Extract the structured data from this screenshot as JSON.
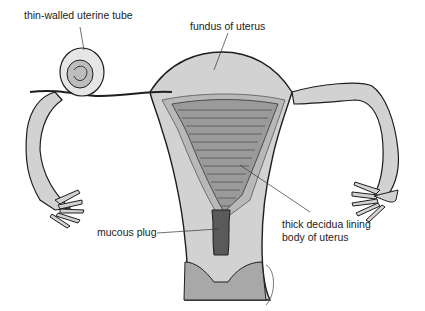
{
  "diagram": {
    "colors": {
      "tissue_light": "#d2d2d2",
      "tissue_mid": "#b8b8b8",
      "tissue_dark": "#8e8e8e",
      "outline": "#1e1e1e",
      "background": "#ffffff",
      "text": "#222222"
    },
    "labels": [
      {
        "id": "uterine-tube",
        "text": "thin-walled uterine tube"
      },
      {
        "id": "fundus",
        "text": "fundus of uterus"
      },
      {
        "id": "mucous-plug",
        "text": "mucous plug"
      },
      {
        "id": "decidua-line1",
        "text": "thick decidua lining"
      },
      {
        "id": "decidua-line2",
        "text": "body of uterus"
      }
    ]
  }
}
